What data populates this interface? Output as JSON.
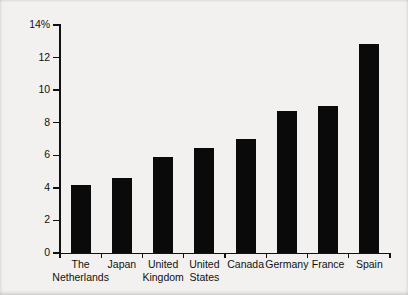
{
  "chart_data": {
    "type": "bar",
    "title": "",
    "xlabel": "",
    "ylabel": "Unemployment rate",
    "categories": [
      "The\nNetherlands",
      "Japan",
      "United\nKingdom",
      "United\nStates",
      "Canada",
      "Germany",
      "France",
      "Spain"
    ],
    "category_lines": [
      [
        "The",
        "Netherlands"
      ],
      [
        "Japan",
        ""
      ],
      [
        "United",
        "Kingdom"
      ],
      [
        "United",
        "States"
      ],
      [
        "Canada",
        ""
      ],
      [
        "Germany",
        ""
      ],
      [
        "France",
        ""
      ],
      [
        "Spain",
        ""
      ]
    ],
    "values": [
      4.15,
      4.6,
      5.9,
      6.45,
      7.0,
      8.7,
      9.0,
      12.85
    ],
    "ylim": [
      0,
      14
    ],
    "ytick_labels": [
      "0",
      "2",
      "4",
      "6",
      "8",
      "10",
      "12",
      "14%"
    ],
    "ytick_values": [
      0,
      2,
      4,
      6,
      8,
      10,
      12,
      14
    ],
    "grid": false,
    "legend": false,
    "bar_color": "#0a0a0a",
    "background_color": "#f2f1ef",
    "axis_color": "#111111"
  },
  "figure": {
    "y_axis_title": "Unemployment rate"
  }
}
